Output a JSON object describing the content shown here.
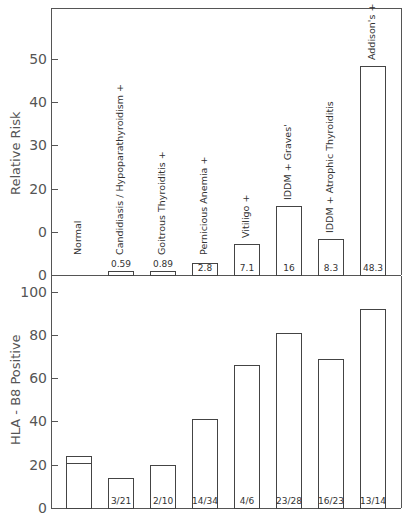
{
  "chart_data": [
    {
      "type": "bar",
      "title": "",
      "ylabel": "Relative Risk",
      "xlabel": "",
      "ylim": [
        0,
        60
      ],
      "yticks": [
        0,
        10,
        20,
        30,
        40,
        50
      ],
      "ytick_labels": [
        "0",
        "0",
        "20",
        "30",
        "40",
        "50"
      ],
      "grid": false,
      "categories": [
        "Normal",
        "Candidiasis / Hypoparathyroidism +",
        "Goitrous Thyroiditis +",
        "Pernicious Anemia +",
        "Vitiligo +",
        "IDDM + Graves'",
        "IDDM + Atrophic Thyroiditis",
        "Addison's + IDDM"
      ],
      "values": [
        null,
        0.59,
        0.89,
        2.8,
        7.1,
        16,
        8.3,
        48.3
      ],
      "value_labels": [
        "",
        "0.59",
        "0.89",
        "2.8",
        "7.1",
        "16",
        "8.3",
        "48.3"
      ]
    },
    {
      "type": "bar",
      "title": "",
      "ylabel": "HLA - B8 Positive",
      "xlabel": "",
      "ylim": [
        0,
        100
      ],
      "yticks": [
        0,
        20,
        40,
        60,
        80,
        100
      ],
      "ytick_labels": [
        "0",
        "20",
        "40",
        "60",
        "80",
        "100"
      ],
      "grid": false,
      "categories": [
        "Normal",
        "Candidiasis / Hypoparathyroidism +",
        "Goitrous Thyroiditis +",
        "Pernicious Anemia +",
        "Vitiligo +",
        "IDDM + Graves'",
        "IDDM + Atrophic Thyroiditis",
        "Addison's + IDDM"
      ],
      "values": [
        24,
        14,
        20,
        41,
        66,
        81,
        69,
        92
      ],
      "normal_inner_line": 21,
      "value_labels": [
        "",
        "3/21",
        "2/10",
        "14/34",
        "4/6",
        "23/28",
        "16/23",
        "13/14"
      ]
    }
  ],
  "layout": {
    "axis_x": 51,
    "right_x": 401,
    "top": {
      "frame_top": 8,
      "baseline": 275,
      "px_per_unit": 4.32
    },
    "bottom": {
      "baseline": 508,
      "px_per_unit": 2.165
    },
    "bar_lefts": [
      66,
      108,
      150,
      192,
      234,
      276,
      318,
      360
    ],
    "bar_width": 26
  }
}
